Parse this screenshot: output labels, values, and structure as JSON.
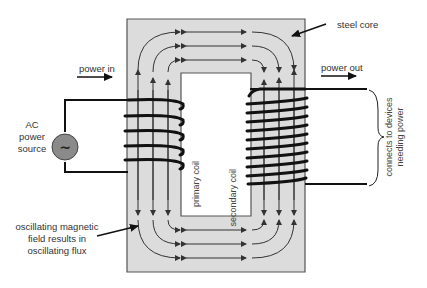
{
  "diagram": {
    "labels": {
      "steel_core": "steel core",
      "power_in": "power in",
      "power_out": "power out",
      "ac_source_line1": "AC",
      "ac_source_line2": "power",
      "ac_source_line3": "source",
      "ac_symbol": "~",
      "primary_coil": "primary coil",
      "secondary_coil": "secondary coil",
      "devices_line1": "connects to devices",
      "devices_line2": "needing power",
      "flux_line1": "oscillating magnetic",
      "flux_line2": "field results in",
      "flux_line3": "oscillating flux"
    },
    "colors": {
      "core_fill": "#dcdcdc",
      "core_stroke": "#555555",
      "wire": "#111111",
      "flux_line": "#333333",
      "source_fill": "#8a8a8a",
      "text": "#333333"
    },
    "coils": {
      "primary_turns": 5,
      "secondary_turns": 10
    }
  }
}
